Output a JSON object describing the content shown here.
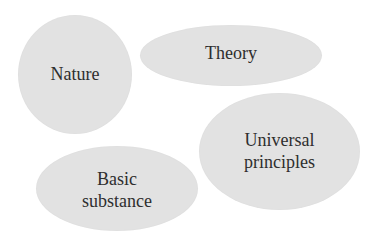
{
  "diagram": {
    "type": "concept-bubbles",
    "fill_color": "#e2e2e2",
    "text_color": "#2e2e2e",
    "bubbles": [
      {
        "id": "nature",
        "label": "Nature"
      },
      {
        "id": "theory",
        "label": "Theory"
      },
      {
        "id": "universal",
        "label": "Universal\nprinciples"
      },
      {
        "id": "basic",
        "label": "Basic\nsubstance"
      }
    ]
  }
}
